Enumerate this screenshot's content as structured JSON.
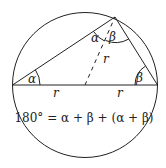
{
  "diagram": {
    "labels": {
      "alpha_left": "α",
      "alpha_top": "α",
      "beta_top": "β",
      "beta_right": "β",
      "r_left": "r",
      "r_right": "r",
      "r_dashed": "r"
    },
    "equation": "180° = α + β + (α + β)",
    "colors": {
      "stroke": "#222222",
      "background": "#ffffff"
    }
  }
}
